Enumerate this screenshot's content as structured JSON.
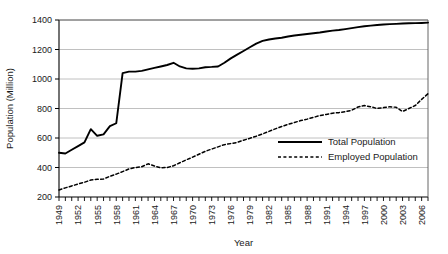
{
  "chart_data": {
    "type": "line",
    "title": "",
    "xlabel": "Year",
    "ylabel": "Population (Million)",
    "ylim": [
      200,
      1400
    ],
    "ytick_step": 200,
    "yticks": [
      200,
      400,
      600,
      800,
      1000,
      1200,
      1400
    ],
    "xlim": [
      1949,
      2007
    ],
    "xtick_labels": [
      "1949",
      "1952",
      "1955",
      "1958",
      "1961",
      "1964",
      "1967",
      "1970",
      "1973",
      "1976",
      "1979",
      "1982",
      "1985",
      "1988",
      "1991",
      "1994",
      "1997",
      "2000",
      "2003",
      "2006"
    ],
    "xtick_label_step": 3,
    "grid": "horizontal",
    "legend_position": "inside-right-middle",
    "x": [
      1949,
      1950,
      1951,
      1952,
      1953,
      1954,
      1955,
      1956,
      1957,
      1958,
      1959,
      1960,
      1961,
      1962,
      1963,
      1964,
      1965,
      1966,
      1967,
      1968,
      1969,
      1970,
      1971,
      1972,
      1973,
      1974,
      1975,
      1976,
      1977,
      1978,
      1979,
      1980,
      1981,
      1982,
      1983,
      1984,
      1985,
      1986,
      1987,
      1988,
      1989,
      1990,
      1991,
      1992,
      1993,
      1994,
      1995,
      1996,
      1997,
      1998,
      1999,
      2000,
      2001,
      2002,
      2003,
      2004,
      2005,
      2006,
      2007
    ],
    "series": [
      {
        "name": "Total Population",
        "style": "solid",
        "color": "#000000",
        "values": [
          500,
          495,
          520,
          545,
          570,
          660,
          615,
          625,
          680,
          700,
          1040,
          1050,
          1050,
          1055,
          1065,
          1075,
          1085,
          1095,
          1110,
          1085,
          1072,
          1070,
          1072,
          1080,
          1082,
          1085,
          1110,
          1140,
          1165,
          1190,
          1215,
          1240,
          1258,
          1268,
          1275,
          1280,
          1288,
          1295,
          1300,
          1305,
          1310,
          1315,
          1322,
          1328,
          1332,
          1338,
          1345,
          1352,
          1358,
          1362,
          1366,
          1370,
          1372,
          1374,
          1376,
          1378,
          1379,
          1380,
          1382
        ]
      },
      {
        "name": "Employed Population",
        "style": "dashed",
        "color": "#000000",
        "values": [
          248,
          262,
          275,
          288,
          300,
          315,
          320,
          322,
          340,
          355,
          372,
          390,
          400,
          405,
          425,
          410,
          398,
          400,
          412,
          432,
          452,
          470,
          490,
          510,
          525,
          540,
          555,
          562,
          570,
          585,
          598,
          612,
          628,
          645,
          662,
          678,
          692,
          705,
          718,
          728,
          740,
          752,
          760,
          768,
          772,
          778,
          788,
          810,
          820,
          812,
          800,
          806,
          812,
          808,
          780,
          800,
          820,
          862,
          900
        ]
      }
    ]
  },
  "legend": {
    "items": [
      {
        "label": "Total Population",
        "style": "solid"
      },
      {
        "label": "Employed Population",
        "style": "dashed"
      }
    ]
  }
}
